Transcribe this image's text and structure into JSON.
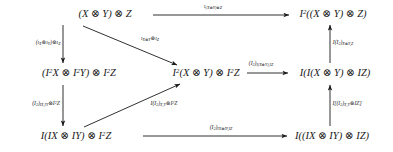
{
  "diagram": {
    "kind": "commutative-diagram",
    "symbols": {
      "tensor": "⊗"
    },
    "nodes": [
      {
        "id": "top-left",
        "text": "(X ⊗ Y) ⊗ Z",
        "x": 105,
        "y": 14
      },
      {
        "id": "top-right",
        "text": "I²((X ⊗ Y) ⊗ Z)",
        "x": 333,
        "y": 14
      },
      {
        "id": "mid-left",
        "text": "(I²X ⊗ I²Y) ⊗ I²Z",
        "x": 79,
        "y": 73
      },
      {
        "id": "mid-center",
        "text": "I²(X ⊗ Y) ⊗ I²Z",
        "x": 206,
        "y": 73
      },
      {
        "id": "mid-right",
        "text": "I(I(X ⊗ Y) ⊗ IZ)",
        "x": 335,
        "y": 73
      },
      {
        "id": "bottom-left",
        "text": "I(IX ⊗ IY) ⊗ I²Z",
        "x": 76,
        "y": 136
      },
      {
        "id": "bottom-right",
        "text": "I((IX ⊗ IY) ⊗ IZ)",
        "x": 332,
        "y": 136
      }
    ],
    "edge_labels": [
      {
        "id": "top-horizontal",
        "html": "ι<sub>(X<span class=\"otimes\">⊗</span>Y)<span class=\"otimes\">⊗</span>Z</sub>",
        "x": 213,
        "y": 7
      },
      {
        "id": "left-vertical-upper",
        "html": "(ι<sub>X</sub><span class=\"otimes\">⊗</span>ι<sub>Y</sub>)<span class=\"otimes\">⊗</span>ι<sub>Z</sub>",
        "x": 48,
        "y": 43
      },
      {
        "id": "diagonal-upper",
        "html": "ι<sub>X<span class=\"otimes\">⊗</span>Y</sub><span class=\"otimes\">⊗</span>ι<sub>Z</sub>",
        "x": 150,
        "y": 39
      },
      {
        "id": "mid-horizontal",
        "html": "(I<sub>2</sub>)<sub>I(X<span class=\"otimes\">⊗</span>Y),IZ</sub>",
        "x": 261,
        "y": 64
      },
      {
        "id": "right-vertical-upper",
        "html": "I(I<sub>2</sub>)<sub>X<span class=\"otimes\">⊗</span>Y,Z</sub>",
        "x": 343,
        "y": 43
      },
      {
        "id": "left-vertical-lower",
        "html": "(I<sub>2</sub>)<sub>IX,IY</sub><span class=\"otimes\">⊗</span>I<sup>2</sup>Z",
        "x": 46,
        "y": 104
      },
      {
        "id": "diagonal-lower",
        "html": "I(I<sub>2</sub>)<sub>X,Y</sub><span class=\"otimes\">⊗</span>I<sup>2</sup>Z",
        "x": 164,
        "y": 104
      },
      {
        "id": "right-vertical-lower",
        "html": "I[(I<sub>2</sub>)<sub>X,Y</sub><span class=\"otimes\">⊗</span>IZ]",
        "x": 347,
        "y": 104
      },
      {
        "id": "bottom-horizontal",
        "html": "(I<sub>2</sub>)<sub>IX<span class=\"otimes\">⊗</span>IY,IZ</sub>",
        "x": 221,
        "y": 128
      }
    ],
    "edges": [
      {
        "id": "edge-top-horizontal",
        "from": "top-left",
        "to": "top-right",
        "x1": 153,
        "y1": 15,
        "x2": 289,
        "y2": 15
      },
      {
        "id": "edge-left-vertical-upper",
        "from": "top-left",
        "to": "mid-left",
        "x1": 63,
        "y1": 25,
        "x2": 63,
        "y2": 63
      },
      {
        "id": "edge-diagonal-upper",
        "from": "top-left",
        "to": "mid-center",
        "x1": 83,
        "y1": 26,
        "x2": 177,
        "y2": 65
      },
      {
        "id": "edge-mid-horizontal",
        "from": "mid-center",
        "to": "mid-right",
        "x1": 247,
        "y1": 73,
        "x2": 288,
        "y2": 73
      },
      {
        "id": "edge-right-vertical-upper",
        "from": "mid-right",
        "to": "top-right",
        "x1": 330,
        "y1": 63,
        "x2": 330,
        "y2": 25
      },
      {
        "id": "edge-left-vertical-lower",
        "from": "mid-left",
        "to": "bottom-left",
        "x1": 63,
        "y1": 85,
        "x2": 63,
        "y2": 126
      },
      {
        "id": "edge-diagonal-lower",
        "from": "bottom-left",
        "to": "mid-center",
        "x1": 84,
        "y1": 127,
        "x2": 180,
        "y2": 84
      },
      {
        "id": "edge-right-vertical-lower",
        "from": "bottom-right",
        "to": "mid-right",
        "x1": 330,
        "y1": 126,
        "x2": 330,
        "y2": 85
      },
      {
        "id": "edge-bottom-horizontal",
        "from": "bottom-left",
        "to": "bottom-right",
        "x1": 143,
        "y1": 136,
        "x2": 287,
        "y2": 136
      }
    ]
  }
}
